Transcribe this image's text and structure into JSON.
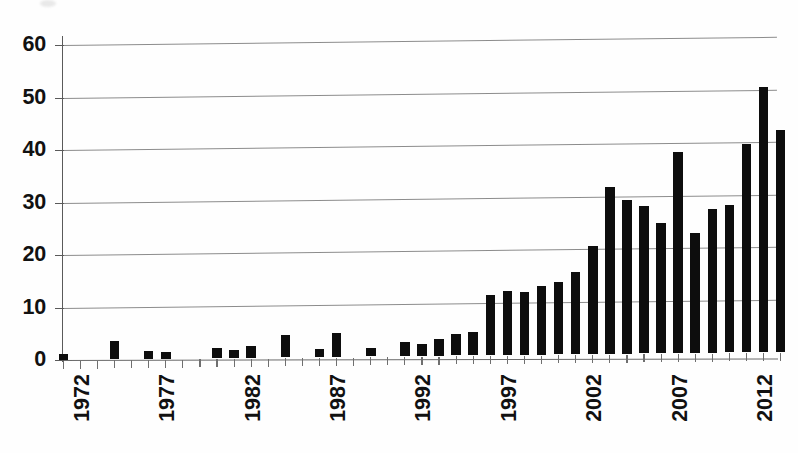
{
  "chart_data": {
    "type": "bar",
    "title": "",
    "subtitle": "",
    "xlabel": "",
    "ylabel": "",
    "ylim": [
      0,
      60
    ],
    "ytick_labels": [
      "0",
      "10",
      "20",
      "30",
      "40",
      "50",
      "60"
    ],
    "ytick_values": [
      0,
      10,
      20,
      30,
      40,
      50,
      60
    ],
    "grid": "horizontal",
    "legend": "none",
    "bar_color": "#0d0d0d",
    "grid_color": "#8c8c8c",
    "axis_color": "#5a5a5a",
    "xtick_label_rotation": -90,
    "xtick_labels_shown": [
      "1972",
      "1977",
      "1982",
      "1987",
      "1992",
      "1997",
      "2002",
      "2007",
      "2012"
    ],
    "categories": [
      "1972",
      "1973",
      "1974",
      "1975",
      "1976",
      "1977",
      "1978",
      "1979",
      "1980",
      "1981",
      "1982",
      "1983",
      "1984",
      "1985",
      "1986",
      "1987",
      "1988",
      "1989",
      "1990",
      "1991",
      "1992",
      "1993",
      "1994",
      "1995",
      "1996",
      "1997",
      "1998",
      "1999",
      "2000",
      "2001",
      "2002",
      "2003",
      "2004",
      "2005",
      "2006",
      "2007",
      "2008",
      "2009",
      "2010",
      "2011",
      "2012",
      "2013",
      "2014"
    ],
    "values": [
      1.1,
      0,
      0,
      3.6,
      0,
      1.6,
      1.3,
      0,
      0,
      1.9,
      1.5,
      2.2,
      0,
      4.2,
      0,
      1.6,
      4.6,
      0,
      1.6,
      0,
      2.7,
      2.2,
      3.2,
      4.1,
      4.5,
      11.5,
      12.2,
      11.9,
      13.0,
      13.7,
      15.7,
      20.6,
      31.7,
      29.3,
      28.0,
      24.8,
      38.2,
      22.8,
      27.3,
      28.1,
      39.6,
      50.4,
      42.3
    ]
  }
}
